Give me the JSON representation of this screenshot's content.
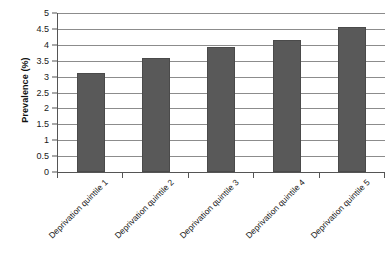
{
  "chart_data": {
    "type": "bar",
    "title": "",
    "subtitle": "",
    "xlabel": "",
    "ylabel": "Prevalence (%)",
    "categories": [
      "Deprivation quintile 1",
      "Deprivation quintile 2",
      "Deprivation quintile 3",
      "Deprivation quintile 4",
      "Deprivation quintile 5"
    ],
    "values": [
      3.1,
      3.6,
      3.93,
      4.15,
      4.55
    ],
    "ylim": [
      0,
      5
    ],
    "ytick_values": [
      0,
      0.5,
      1,
      1.5,
      2,
      2.5,
      3,
      3.5,
      4,
      4.5,
      5
    ],
    "ytick_labels": [
      "0",
      "0.5",
      "1",
      "1.5",
      "2",
      "2.5",
      "3",
      "3.5",
      "4",
      "4.5",
      "5"
    ],
    "grid": true,
    "grid_axis": "y",
    "legend": false,
    "legend_position": "none",
    "bar_color": "#595959",
    "gridline_color": "#8c8c8c",
    "axis_color": "#555555",
    "background_color": "#ffffff",
    "xtick_label_rotation": -45
  }
}
